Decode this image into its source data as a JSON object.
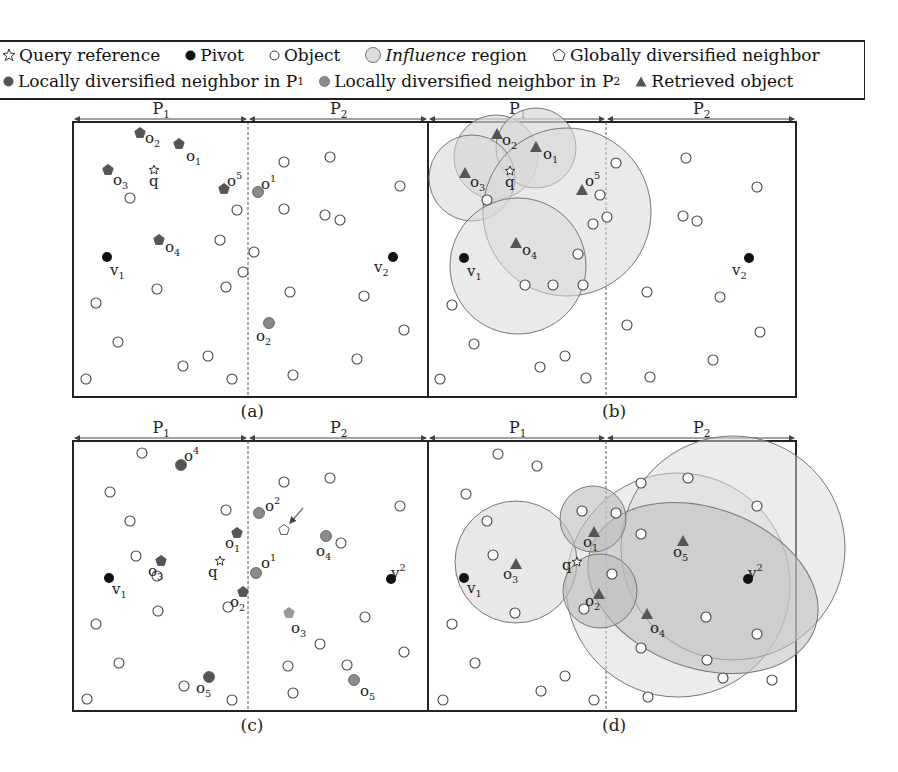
{
  "legend": {
    "row1": [
      {
        "icon": "star-outline-icon",
        "label": "Query reference"
      },
      {
        "icon": "filled-circle-icon",
        "label": "Pivot"
      },
      {
        "icon": "hollow-circle-icon",
        "label": "Object"
      },
      {
        "icon": "shaded-circle-icon",
        "label_italic": "Influence",
        "label": " region"
      },
      {
        "icon": "pentagon-outline-icon",
        "label": "Globally diversified neighbor"
      }
    ],
    "row2": [
      {
        "icon": "dark-circle-icon",
        "label": "Locally diversified neighbor in P",
        "sub": "1"
      },
      {
        "icon": "gray-circle-icon",
        "label": "Locally diversified neighbor in P",
        "sub": "2"
      },
      {
        "icon": "triangle-icon",
        "label": "Retrieved object"
      }
    ]
  },
  "colors": {
    "pivot": "#111111",
    "local_p1": "#555555",
    "local_p2": "#8a8a8a",
    "retrieved": "#555555",
    "influence_fill": "#d9d9d9",
    "influence_dark": "#bdbdbd",
    "border": "#222222"
  },
  "panels": [
    {
      "caption": "(a)",
      "partition_labels": [
        "P1",
        "P2"
      ]
    },
    {
      "caption": "(b)",
      "partition_labels": [
        "P1",
        "P2"
      ]
    },
    {
      "caption": "(c)",
      "partition_labels": [
        "P1",
        "P2"
      ]
    },
    {
      "caption": "(d)",
      "partition_labels": [
        "P1",
        "P2"
      ]
    }
  ],
  "labels": {
    "q": "q",
    "v1": "v",
    "v2": "v",
    "o": "o",
    "P": "P"
  }
}
